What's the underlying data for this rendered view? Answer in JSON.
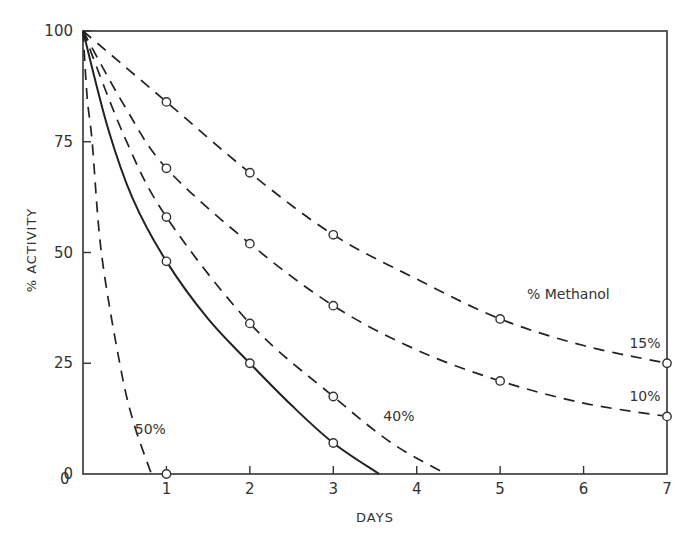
{
  "chart_data": {
    "type": "line",
    "title": "",
    "xlabel": "DAYS",
    "ylabel": "% ACTIVITY",
    "xlim": [
      0,
      7
    ],
    "ylim": [
      0,
      100
    ],
    "x_ticks": [
      1,
      2,
      3,
      4,
      5,
      6,
      7
    ],
    "x_tick_labels": [
      "1",
      "2",
      "3",
      "4",
      "5",
      "6",
      "7"
    ],
    "x_origin_label": "0",
    "y_ticks": [
      0,
      25,
      50,
      75,
      100
    ],
    "y_tick_labels": [
      "0",
      "25",
      "50",
      "75",
      "100"
    ],
    "grid": false,
    "legend_title": "% Methanol",
    "series": [
      {
        "name": "15%",
        "style": "dashed",
        "points": [
          [
            0,
            100
          ],
          [
            1,
            84
          ],
          [
            2,
            68
          ],
          [
            3,
            54
          ],
          [
            5,
            35
          ],
          [
            7,
            25
          ]
        ],
        "curve": [
          [
            0,
            100
          ],
          [
            1,
            84
          ],
          [
            2,
            68
          ],
          [
            3,
            54
          ],
          [
            4,
            44
          ],
          [
            5,
            35
          ],
          [
            6,
            29
          ],
          [
            7,
            25
          ]
        ],
        "label": "15%",
        "label_pos": [
          6.55,
          28.5
        ]
      },
      {
        "name": "10%",
        "style": "dashed",
        "points": [
          [
            0,
            100
          ],
          [
            1,
            69
          ],
          [
            2,
            52
          ],
          [
            3,
            38
          ],
          [
            5,
            21
          ],
          [
            7,
            13
          ]
        ],
        "curve": [
          [
            0,
            100
          ],
          [
            0.5,
            83
          ],
          [
            1,
            69
          ],
          [
            2,
            52
          ],
          [
            3,
            38
          ],
          [
            4,
            28
          ],
          [
            5,
            21
          ],
          [
            6,
            16
          ],
          [
            7,
            13
          ]
        ],
        "label": "10%",
        "label_pos": [
          6.55,
          16.5
        ]
      },
      {
        "name": "40%",
        "style": "dashed",
        "points": [
          [
            0,
            100
          ],
          [
            1,
            58
          ],
          [
            2,
            34
          ],
          [
            3,
            17.5
          ]
        ],
        "curve": [
          [
            0,
            100
          ],
          [
            0.5,
            76
          ],
          [
            1,
            58
          ],
          [
            2,
            34
          ],
          [
            3,
            17.5
          ],
          [
            3.7,
            7
          ],
          [
            4.35,
            0
          ]
        ],
        "label": "40%",
        "label_pos": [
          3.6,
          12
        ]
      },
      {
        "name": "control (0%)",
        "style": "solid",
        "points": [
          [
            0,
            100
          ],
          [
            1,
            48
          ],
          [
            2,
            25
          ],
          [
            3,
            7
          ]
        ],
        "curve": [
          [
            0,
            100
          ],
          [
            0.3,
            78
          ],
          [
            0.6,
            62
          ],
          [
            1,
            48
          ],
          [
            1.5,
            35
          ],
          [
            2,
            25
          ],
          [
            2.5,
            15.5
          ],
          [
            3,
            7
          ],
          [
            3.55,
            0
          ]
        ],
        "label": ""
      },
      {
        "name": "50%",
        "style": "dashed",
        "points": [
          [
            0,
            100
          ],
          [
            1,
            0
          ]
        ],
        "curve": [
          [
            0,
            100
          ],
          [
            0.05,
            85
          ],
          [
            0.11,
            75
          ],
          [
            0.22,
            50
          ],
          [
            0.44,
            25
          ],
          [
            0.6,
            12
          ],
          [
            0.82,
            0
          ]
        ],
        "label": "50%",
        "label_pos": [
          0.62,
          9
        ]
      }
    ]
  }
}
